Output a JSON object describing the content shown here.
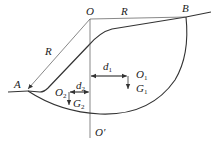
{
  "figure": {
    "type": "slope-stability-circular-slip-diagram",
    "colors": {
      "line": "#333333",
      "thin_line": "#555555",
      "background": "#ffffff"
    },
    "points": {
      "O": {
        "label": "O",
        "x": 90,
        "y": 19
      },
      "O_prime": {
        "label": "O'",
        "x": 90,
        "y": 138
      },
      "A": {
        "label": "A",
        "x": 27,
        "y": 90
      },
      "B": {
        "label": "B",
        "x": 186,
        "y": 16
      },
      "O1": {
        "label": "O",
        "sub": "1"
      },
      "O2": {
        "label": "O",
        "sub": "2"
      }
    },
    "labels": {
      "O": "O",
      "O_prime": "O′",
      "A": "A",
      "B": "B",
      "R_top": "R",
      "R_left": "R",
      "O1_main": "O",
      "O1_sub": "1",
      "O2_main": "O",
      "O2_sub": "2",
      "G1_main": "G",
      "G1_sub": "1",
      "G2_main": "G",
      "G2_sub": "2",
      "d1_main": "d",
      "d1_sub": "1",
      "d2_main": "d",
      "d2_sub": "2"
    },
    "elements": [
      "radius line O-B (R)",
      "radius line O-A (R)",
      "vertical centerline O-O′",
      "slope surface from A to B",
      "circular slip arc from A to B",
      "moment arm d1 to weight G1 at O1",
      "moment arm d2 to weight G2 at O2"
    ]
  }
}
